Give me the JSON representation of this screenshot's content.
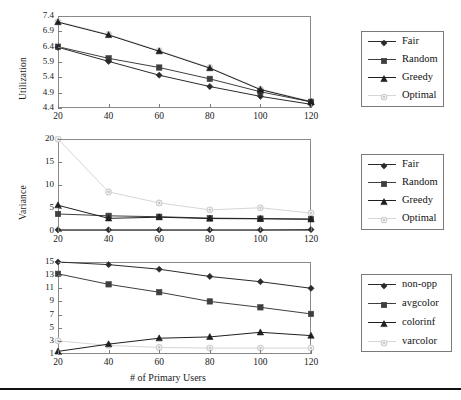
{
  "figure": {
    "xlabel": "# of Primary Users",
    "xticks": [
      "20",
      "40",
      "60",
      "80",
      "100",
      "120"
    ],
    "colors": {
      "dark": "#2b2b2b",
      "mid": "#4a4a4a",
      "light": "#d8d8d8",
      "frame": "#8a8a8a"
    }
  },
  "chart_data": [
    {
      "type": "line",
      "title": "",
      "xlabel": "# of Primary Users",
      "ylabel": "Utilization",
      "x": [
        20,
        40,
        60,
        80,
        100,
        120
      ],
      "xlim": [
        20,
        120
      ],
      "ylim": [
        4.4,
        7.4
      ],
      "yticks": [
        "4.4",
        "4.9",
        "5.4",
        "5.9",
        "6.4",
        "6.9",
        "7.4"
      ],
      "grid": false,
      "legend_position": "right",
      "series": [
        {
          "name": "Fair",
          "marker": "diamond",
          "values": [
            6.38,
            5.92,
            5.47,
            5.1,
            4.78,
            4.52
          ]
        },
        {
          "name": "Random",
          "marker": "square",
          "values": [
            6.4,
            6.02,
            5.72,
            5.35,
            4.93,
            4.6
          ]
        },
        {
          "name": "Greedy",
          "marker": "triangle",
          "values": [
            7.2,
            6.78,
            6.25,
            5.7,
            5.0,
            4.6
          ]
        },
        {
          "name": "Optimal",
          "marker": "circle",
          "values": [
            7.22,
            6.8,
            6.27,
            5.72,
            5.02,
            4.62
          ]
        }
      ]
    },
    {
      "type": "line",
      "title": "",
      "xlabel": "# of Primary Users",
      "ylabel": "Variance",
      "x": [
        20,
        40,
        60,
        80,
        100,
        120
      ],
      "xlim": [
        20,
        120
      ],
      "ylim": [
        0,
        20
      ],
      "yticks": [
        "0",
        "5",
        "10",
        "15",
        "20"
      ],
      "grid": false,
      "legend_position": "right",
      "series": [
        {
          "name": "Fair",
          "marker": "diamond",
          "values": [
            0.25,
            0.25,
            0.25,
            0.25,
            0.25,
            0.3
          ]
        },
        {
          "name": "Random",
          "marker": "square",
          "values": [
            3.7,
            3.3,
            3.1,
            2.8,
            2.7,
            2.6
          ]
        },
        {
          "name": "Greedy",
          "marker": "triangle",
          "values": [
            5.6,
            2.75,
            3.0,
            2.7,
            2.65,
            2.55
          ]
        },
        {
          "name": "Optimal",
          "marker": "circle",
          "values": [
            20.5,
            8.5,
            6.1,
            4.6,
            5.05,
            3.9
          ]
        }
      ]
    },
    {
      "type": "line",
      "title": "",
      "xlabel": "# of Primary Users",
      "ylabel": "",
      "x": [
        20,
        40,
        60,
        80,
        100,
        120
      ],
      "xlim": [
        20,
        120
      ],
      "ylim": [
        1,
        15
      ],
      "yticks": [
        "1",
        "3",
        "5",
        "7",
        "9",
        "11",
        "13",
        "15"
      ],
      "grid": false,
      "legend_position": "right",
      "series": [
        {
          "name": "non-opp",
          "marker": "diamond",
          "values": [
            15.0,
            14.6,
            13.9,
            12.8,
            12.0,
            11.0
          ]
        },
        {
          "name": "avgcolor",
          "marker": "square",
          "values": [
            13.2,
            11.6,
            10.4,
            9.0,
            8.1,
            7.1
          ]
        },
        {
          "name": "colorinf",
          "marker": "triangle",
          "values": [
            1.4,
            2.5,
            3.4,
            3.6,
            4.3,
            3.8
          ]
        },
        {
          "name": "varcolor",
          "marker": "circle",
          "values": [
            3.0,
            2.3,
            2.0,
            1.9,
            1.9,
            1.9
          ]
        }
      ]
    }
  ],
  "legends": [
    {
      "items": [
        {
          "label": "Fair",
          "marker": "diamond-marker",
          "color": "#2b2b2b"
        },
        {
          "label": "Random",
          "marker": "square-marker",
          "color": "#3a3a3a"
        },
        {
          "label": "Greedy",
          "marker": "triangle-marker",
          "color": "#222222"
        },
        {
          "label": "Optimal",
          "marker": "circle-marker",
          "color": "#d5d5d5"
        }
      ]
    },
    {
      "items": [
        {
          "label": "Fair",
          "marker": "diamond-marker",
          "color": "#2b2b2b"
        },
        {
          "label": "Random",
          "marker": "square-marker",
          "color": "#3a3a3a"
        },
        {
          "label": "Greedy",
          "marker": "triangle-marker",
          "color": "#222222"
        },
        {
          "label": "Optimal",
          "marker": "circle-marker",
          "color": "#d5d5d5"
        }
      ]
    },
    {
      "items": [
        {
          "label": "non-opp",
          "marker": "diamond-marker",
          "color": "#2b2b2b"
        },
        {
          "label": "avgcolor",
          "marker": "square-marker",
          "color": "#3a3a3a"
        },
        {
          "label": "colorinf",
          "marker": "triangle-marker",
          "color": "#222222"
        },
        {
          "label": "varcolor",
          "marker": "circle-marker",
          "color": "#d5d5d5"
        }
      ]
    }
  ]
}
